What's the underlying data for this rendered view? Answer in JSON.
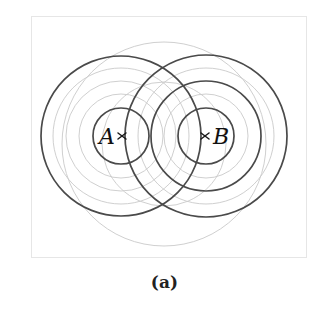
{
  "figure": {
    "caption": "(a)",
    "width": 329,
    "height": 315,
    "frame": {
      "x": 31,
      "y": 16,
      "width": 276,
      "height": 242
    },
    "colors": {
      "background": "#ffffff",
      "frame_stroke": "#e6e6e6",
      "faint_circle_stroke": "#c9c9c9",
      "dark_circle_stroke": "#4a4a4a",
      "label_text": "#111111",
      "caption_text": "#222222"
    },
    "points": [
      {
        "id": "A",
        "label": "A",
        "cx": 121,
        "cy": 136,
        "label_x": 107,
        "label_y": 143,
        "label_anchor": "middle"
      },
      {
        "id": "B",
        "label": "B",
        "cx": 206,
        "cy": 136,
        "label_x": 221,
        "label_y": 143,
        "label_anchor": "middle"
      }
    ],
    "circles_dark": [
      {
        "center": "A",
        "cx": 121,
        "cy": 136,
        "r": 28
      },
      {
        "center": "A",
        "cx": 121,
        "cy": 136,
        "r": 80
      },
      {
        "center": "B",
        "cx": 206,
        "cy": 136,
        "r": 28
      },
      {
        "center": "B",
        "cx": 206,
        "cy": 136,
        "r": 55
      },
      {
        "center": "B",
        "cx": 206,
        "cy": 136,
        "r": 81
      }
    ],
    "circles_faint": [
      {
        "center": "A",
        "cx": 121,
        "cy": 136,
        "r": 42
      },
      {
        "center": "A",
        "cx": 121,
        "cy": 136,
        "r": 55
      },
      {
        "center": "A",
        "cx": 121,
        "cy": 136,
        "r": 68
      },
      {
        "center": "B",
        "cx": 206,
        "cy": 136,
        "r": 42
      },
      {
        "center": "B",
        "cx": 206,
        "cy": 136,
        "r": 68
      },
      {
        "center": "M",
        "cx": 164,
        "cy": 144,
        "r": 102
      },
      {
        "center": "M",
        "cx": 164,
        "cy": 144,
        "r": 62
      }
    ],
    "cross_marks": [
      {
        "id": "cross-A",
        "cx": 122,
        "cy": 136,
        "size": 5
      },
      {
        "id": "cross-B",
        "cx": 205,
        "cy": 136,
        "size": 5
      }
    ],
    "caption_position": {
      "x": 0,
      "y": 272
    }
  }
}
